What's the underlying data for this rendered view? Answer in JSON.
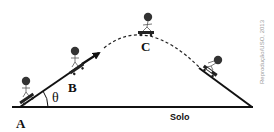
{
  "figure": {
    "labels": {
      "point_a": "A",
      "point_b": "B",
      "point_c": "C",
      "angle": "θ",
      "ground": "Solo"
    },
    "credit": "Reprodução/USO, 2013",
    "colors": {
      "line": "#111111",
      "skater_head": "#333333",
      "credit_text": "#9a9a9a",
      "background": "#ffffff"
    },
    "elements": [
      "ground-line",
      "launch-ramp",
      "velocity-arrow",
      "dashed-trajectory",
      "landing-ramp",
      "skater-at-a",
      "skater-at-b",
      "skater-at-c",
      "skater-landing"
    ]
  }
}
